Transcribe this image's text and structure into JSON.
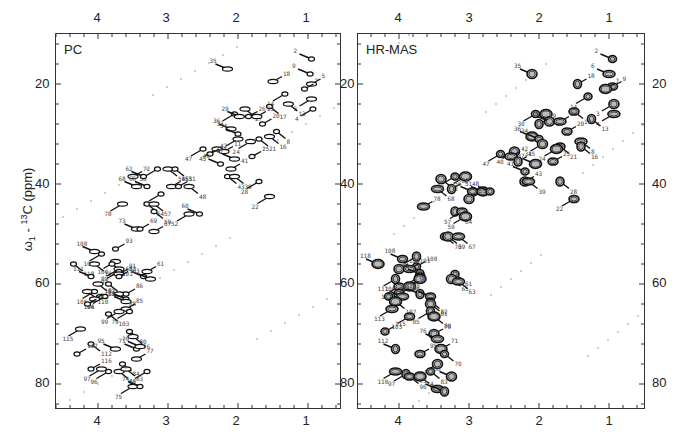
{
  "figure": {
    "ylabel": "ω1 - 13C (ppm)",
    "ylabel_parts": {
      "omega": "ω",
      "sub": "1",
      "sep": " - ",
      "sup": "13",
      "rest": "C (ppm)"
    }
  },
  "panels": [
    {
      "id": "pc",
      "title": "PC"
    },
    {
      "id": "hrmas",
      "title": "HR-MAS"
    }
  ],
  "axes": {
    "x_ticks": [
      "4",
      "3",
      "2",
      "1"
    ],
    "y_ticks": [
      "20",
      "40",
      "60",
      "80"
    ]
  },
  "chart_data": [
    {
      "type": "scatter",
      "title": "PC",
      "xlabel": "ω2 - 1H (ppm)",
      "ylabel": "ω1 - 13C (ppm)",
      "xlim": [
        4.6,
        0.6
      ],
      "ylim": [
        10,
        85
      ],
      "x_ticks": [
        4,
        3,
        2,
        1
      ],
      "y_ticks": [
        20,
        40,
        60,
        80
      ],
      "grid": false,
      "peaks": [
        {
          "label": "2",
          "x": 0.95,
          "y": 15
        },
        {
          "label": "35",
          "x": 2.15,
          "y": 17
        },
        {
          "label": "9",
          "x": 0.97,
          "y": 18
        },
        {
          "label": "5",
          "x": 0.95,
          "y": 20
        },
        {
          "label": "7",
          "x": 1.05,
          "y": 21
        },
        {
          "label": "18",
          "x": 1.5,
          "y": 19.5
        },
        {
          "label": "14",
          "x": 1.33,
          "y": 22
        },
        {
          "label": "3",
          "x": 0.95,
          "y": 23
        },
        {
          "label": "4",
          "x": 0.93,
          "y": 25
        },
        {
          "label": "13",
          "x": 1.28,
          "y": 24
        },
        {
          "label": "17",
          "x": 1.55,
          "y": 24.5
        },
        {
          "label": "27",
          "x": 1.9,
          "y": 25
        },
        {
          "label": "33",
          "x": 2.05,
          "y": 26
        },
        {
          "label": "29",
          "x": 1.98,
          "y": 26.5
        },
        {
          "label": "26",
          "x": 1.85,
          "y": 26.5
        },
        {
          "label": "23",
          "x": 1.73,
          "y": 26.5
        },
        {
          "label": "20",
          "x": 1.65,
          "y": 28
        },
        {
          "label": "36",
          "x": 2.1,
          "y": 29
        },
        {
          "label": "34",
          "x": 2.0,
          "y": 30
        },
        {
          "label": "31",
          "x": 2.0,
          "y": 31
        },
        {
          "label": "8",
          "x": 1.45,
          "y": 29.5
        },
        {
          "label": "16",
          "x": 1.55,
          "y": 30.5
        },
        {
          "label": "21",
          "x": 1.7,
          "y": 31
        },
        {
          "label": "24",
          "x": 1.82,
          "y": 31.5
        },
        {
          "label": "47",
          "x": 2.5,
          "y": 33
        },
        {
          "label": "45",
          "x": 2.3,
          "y": 33
        },
        {
          "label": "42",
          "x": 2.4,
          "y": 34
        },
        {
          "label": "11",
          "x": 2.2,
          "y": 33.5
        },
        {
          "label": "25",
          "x": 1.8,
          "y": 34.5
        },
        {
          "label": "37",
          "x": 2.05,
          "y": 35
        },
        {
          "label": "49",
          "x": 2.25,
          "y": 36
        },
        {
          "label": "41",
          "x": 2.1,
          "y": 37
        },
        {
          "label": "43",
          "x": 2.15,
          "y": 38.5
        },
        {
          "label": "39",
          "x": 2.05,
          "y": 38.5
        },
        {
          "label": "28",
          "x": 1.7,
          "y": 39.5
        },
        {
          "label": "22",
          "x": 1.55,
          "y": 42.5
        },
        {
          "label": "58",
          "x": 3.15,
          "y": 37
        },
        {
          "label": "54",
          "x": 3.0,
          "y": 37
        },
        {
          "label": "53",
          "x": 2.9,
          "y": 37
        },
        {
          "label": "72",
          "x": 3.5,
          "y": 38.5
        },
        {
          "label": "62",
          "x": 3.35,
          "y": 38.5
        },
        {
          "label": "68",
          "x": 3.45,
          "y": 40.5
        },
        {
          "label": "66",
          "x": 3.3,
          "y": 40.5
        },
        {
          "label": "56",
          "x": 2.95,
          "y": 40.5
        },
        {
          "label": "51",
          "x": 2.85,
          "y": 40.5
        },
        {
          "label": "48",
          "x": 2.7,
          "y": 40.5
        },
        {
          "label": "55",
          "x": 3.1,
          "y": 42
        },
        {
          "label": "78",
          "x": 3.65,
          "y": 44
        },
        {
          "label": "64",
          "x": 3.3,
          "y": 44
        },
        {
          "label": "57",
          "x": 3.2,
          "y": 44
        },
        {
          "label": "59",
          "x": 3.2,
          "y": 45.5
        },
        {
          "label": "52",
          "x": 2.7,
          "y": 46
        },
        {
          "label": "60",
          "x": 2.55,
          "y": 46
        },
        {
          "label": "73",
          "x": 3.45,
          "y": 49
        },
        {
          "label": "69",
          "x": 3.4,
          "y": 49
        },
        {
          "label": "67",
          "x": 3.2,
          "y": 49.5
        },
        {
          "label": "93",
          "x": 3.75,
          "y": 53
        },
        {
          "label": "108",
          "x": 4.05,
          "y": 53.5
        },
        {
          "label": "102",
          "x": 3.95,
          "y": 54
        },
        {
          "label": "100",
          "x": 3.75,
          "y": 55.5
        },
        {
          "label": "101",
          "x": 3.8,
          "y": 56
        },
        {
          "label": "104",
          "x": 4.05,
          "y": 56
        },
        {
          "label": "118",
          "x": 4.35,
          "y": 56
        },
        {
          "label": "89",
          "x": 3.7,
          "y": 57
        },
        {
          "label": "92",
          "x": 3.7,
          "y": 57.5
        },
        {
          "label": "91",
          "x": 3.7,
          "y": 58
        },
        {
          "label": "83",
          "x": 3.7,
          "y": 58.5
        },
        {
          "label": "61",
          "x": 3.3,
          "y": 57.5
        },
        {
          "label": "65",
          "x": 3.35,
          "y": 58.5
        },
        {
          "label": "63",
          "x": 3.25,
          "y": 59
        },
        {
          "label": "111",
          "x": 4.1,
          "y": 58.5
        },
        {
          "label": "109",
          "x": 4.0,
          "y": 60
        },
        {
          "label": "98",
          "x": 3.85,
          "y": 60
        },
        {
          "label": "110",
          "x": 4.15,
          "y": 61.5
        },
        {
          "label": "105",
          "x": 4.05,
          "y": 61.5
        },
        {
          "label": "106",
          "x": 3.95,
          "y": 62.5
        },
        {
          "label": "94",
          "x": 3.9,
          "y": 62.5
        },
        {
          "label": "88",
          "x": 3.7,
          "y": 62
        },
        {
          "label": "86",
          "x": 3.6,
          "y": 62
        },
        {
          "label": "107",
          "x": 4.05,
          "y": 63
        },
        {
          "label": "82",
          "x": 3.6,
          "y": 63
        },
        {
          "label": "81",
          "x": 3.6,
          "y": 63.5
        },
        {
          "label": "113",
          "x": 4.15,
          "y": 64
        },
        {
          "label": "85",
          "x": 3.6,
          "y": 65
        },
        {
          "label": "103",
          "x": 3.85,
          "y": 66
        },
        {
          "label": "99",
          "x": 3.7,
          "y": 65.5
        },
        {
          "label": "79",
          "x": 3.55,
          "y": 65.5
        },
        {
          "label": "115",
          "x": 4.25,
          "y": 69
        },
        {
          "label": "80",
          "x": 3.55,
          "y": 69.5
        },
        {
          "label": "76",
          "x": 3.5,
          "y": 70.5
        },
        {
          "label": "112",
          "x": 4.1,
          "y": 72
        },
        {
          "label": "95",
          "x": 3.75,
          "y": 73
        },
        {
          "label": "71",
          "x": 3.45,
          "y": 73
        },
        {
          "label": "70",
          "x": 3.4,
          "y": 72.5
        },
        {
          "label": "117",
          "x": 4.3,
          "y": 74
        },
        {
          "label": "77",
          "x": 3.45,
          "y": 75
        },
        {
          "label": "116",
          "x": 4.1,
          "y": 77
        },
        {
          "label": "97",
          "x": 3.95,
          "y": 77
        },
        {
          "label": "96",
          "x": 3.85,
          "y": 77.5
        },
        {
          "label": "87",
          "x": 3.7,
          "y": 77.5
        },
        {
          "label": "84",
          "x": 3.65,
          "y": 76
        },
        {
          "label": "83b",
          "x": 3.6,
          "y": 77
        },
        {
          "label": "66b",
          "x": 3.3,
          "y": 77.5
        },
        {
          "label": "75",
          "x": 3.5,
          "y": 80.5
        },
        {
          "label": "74",
          "x": 3.4,
          "y": 80.5
        }
      ]
    },
    {
      "type": "scatter",
      "title": "HR-MAS",
      "xlabel": "ω2 - 1H (ppm)",
      "ylabel": "ω1 - 13C (ppm)",
      "xlim": [
        4.6,
        0.6
      ],
      "ylim": [
        10,
        85
      ],
      "x_ticks": [
        4,
        3,
        2,
        1
      ],
      "y_ticks": [
        20,
        40,
        60,
        80
      ],
      "grid": false,
      "peaks": [
        {
          "label": "2",
          "x": 0.95,
          "y": 15
        },
        {
          "label": "35",
          "x": 2.1,
          "y": 18
        },
        {
          "label": "6",
          "x": 1.0,
          "y": 18
        },
        {
          "label": "18",
          "x": 1.45,
          "y": 20
        },
        {
          "label": "9",
          "x": 0.95,
          "y": 20.5
        },
        {
          "label": "7",
          "x": 1.05,
          "y": 21
        },
        {
          "label": "14",
          "x": 1.3,
          "y": 22.5
        },
        {
          "label": "3",
          "x": 0.93,
          "y": 24
        },
        {
          "label": "4",
          "x": 0.93,
          "y": 26
        },
        {
          "label": "13",
          "x": 1.25,
          "y": 27
        },
        {
          "label": "17",
          "x": 1.5,
          "y": 25.5
        },
        {
          "label": "27",
          "x": 1.9,
          "y": 26
        },
        {
          "label": "30",
          "x": 2.05,
          "y": 26
        },
        {
          "label": "26",
          "x": 1.85,
          "y": 27.5
        },
        {
          "label": "23",
          "x": 1.7,
          "y": 27.5
        },
        {
          "label": "29",
          "x": 2.0,
          "y": 28
        },
        {
          "label": "20",
          "x": 1.6,
          "y": 29.5
        },
        {
          "label": "36",
          "x": 2.1,
          "y": 30.5
        },
        {
          "label": "34",
          "x": 2.0,
          "y": 31
        },
        {
          "label": "31",
          "x": 1.95,
          "y": 32
        },
        {
          "label": "8",
          "x": 1.4,
          "y": 31.5
        },
        {
          "label": "16",
          "x": 1.4,
          "y": 32.5
        },
        {
          "label": "21",
          "x": 1.7,
          "y": 32.5
        },
        {
          "label": "24",
          "x": 1.75,
          "y": 33
        },
        {
          "label": "47",
          "x": 2.55,
          "y": 34
        },
        {
          "label": "40",
          "x": 2.35,
          "y": 33.5
        },
        {
          "label": "42",
          "x": 2.4,
          "y": 34.5
        },
        {
          "label": "45",
          "x": 2.3,
          "y": 35.5
        },
        {
          "label": "25",
          "x": 1.8,
          "y": 35.5
        },
        {
          "label": "37",
          "x": 2.05,
          "y": 36
        },
        {
          "label": "41",
          "x": 2.2,
          "y": 37.5
        },
        {
          "label": "43",
          "x": 2.2,
          "y": 39.5
        },
        {
          "label": "39",
          "x": 2.15,
          "y": 39.5
        },
        {
          "label": "28",
          "x": 1.7,
          "y": 39.5
        },
        {
          "label": "22",
          "x": 1.5,
          "y": 43
        },
        {
          "label": "58",
          "x": 3.05,
          "y": 38.5
        },
        {
          "label": "62",
          "x": 3.2,
          "y": 38.5
        },
        {
          "label": "72",
          "x": 3.4,
          "y": 39
        },
        {
          "label": "68",
          "x": 3.45,
          "y": 41
        },
        {
          "label": "66",
          "x": 3.25,
          "y": 41
        },
        {
          "label": "56",
          "x": 2.95,
          "y": 41.5
        },
        {
          "label": "51",
          "x": 2.8,
          "y": 41.5
        },
        {
          "label": "48",
          "x": 2.7,
          "y": 41.5
        },
        {
          "label": "55",
          "x": 3.0,
          "y": 43
        },
        {
          "label": "78",
          "x": 3.65,
          "y": 44.5
        },
        {
          "label": "64",
          "x": 3.2,
          "y": 45.5
        },
        {
          "label": "57",
          "x": 3.1,
          "y": 45.5
        },
        {
          "label": "59",
          "x": 3.05,
          "y": 46.5
        },
        {
          "label": "73",
          "x": 3.35,
          "y": 50.5
        },
        {
          "label": "69",
          "x": 3.3,
          "y": 50.5
        },
        {
          "label": "67",
          "x": 3.15,
          "y": 50.5
        },
        {
          "label": "93",
          "x": 3.75,
          "y": 54.5
        },
        {
          "label": "108",
          "x": 3.95,
          "y": 55
        },
        {
          "label": "118",
          "x": 4.3,
          "y": 56
        },
        {
          "label": "100",
          "x": 3.75,
          "y": 56.5
        },
        {
          "label": "104",
          "x": 4.0,
          "y": 57
        },
        {
          "label": "101",
          "x": 3.85,
          "y": 57
        },
        {
          "label": "89",
          "x": 3.7,
          "y": 58
        },
        {
          "label": "92",
          "x": 3.7,
          "y": 58.5
        },
        {
          "label": "91",
          "x": 3.7,
          "y": 59
        },
        {
          "label": "61",
          "x": 3.2,
          "y": 58
        },
        {
          "label": "65",
          "x": 3.25,
          "y": 59
        },
        {
          "label": "63",
          "x": 3.15,
          "y": 59.5
        },
        {
          "label": "111",
          "x": 4.05,
          "y": 59
        },
        {
          "label": "109",
          "x": 4.0,
          "y": 60.5
        },
        {
          "label": "98",
          "x": 3.85,
          "y": 60.5
        },
        {
          "label": "114",
          "x": 4.15,
          "y": 62.5
        },
        {
          "label": "105",
          "x": 4.0,
          "y": 62
        },
        {
          "label": "106",
          "x": 3.95,
          "y": 62.5
        },
        {
          "label": "88",
          "x": 3.7,
          "y": 62
        },
        {
          "label": "86",
          "x": 3.55,
          "y": 62.5
        },
        {
          "label": "107",
          "x": 4.05,
          "y": 63.5
        },
        {
          "label": "82",
          "x": 3.55,
          "y": 63.5
        },
        {
          "label": "81",
          "x": 3.55,
          "y": 64
        },
        {
          "label": "113",
          "x": 4.1,
          "y": 65
        },
        {
          "label": "85",
          "x": 3.55,
          "y": 65.5
        },
        {
          "label": "103",
          "x": 3.85,
          "y": 66.5
        },
        {
          "label": "79",
          "x": 3.5,
          "y": 66.5
        },
        {
          "label": "115",
          "x": 4.2,
          "y": 69.5
        },
        {
          "label": "80",
          "x": 3.5,
          "y": 70
        },
        {
          "label": "76",
          "x": 3.45,
          "y": 71
        },
        {
          "label": "112",
          "x": 4.05,
          "y": 73
        },
        {
          "label": "95",
          "x": 3.7,
          "y": 74
        },
        {
          "label": "71",
          "x": 3.4,
          "y": 73
        },
        {
          "label": "70",
          "x": 3.35,
          "y": 74
        },
        {
          "label": "77",
          "x": 3.45,
          "y": 76
        },
        {
          "label": "110",
          "x": 4.05,
          "y": 77.5
        },
        {
          "label": "97",
          "x": 3.9,
          "y": 78
        },
        {
          "label": "96",
          "x": 3.85,
          "y": 78.5
        },
        {
          "label": "87",
          "x": 3.7,
          "y": 78.5
        },
        {
          "label": "83",
          "x": 3.55,
          "y": 77.5
        },
        {
          "label": "66b",
          "x": 3.25,
          "y": 78.5
        },
        {
          "label": "75",
          "x": 3.45,
          "y": 81
        },
        {
          "label": "74",
          "x": 3.35,
          "y": 81.5
        }
      ]
    }
  ]
}
